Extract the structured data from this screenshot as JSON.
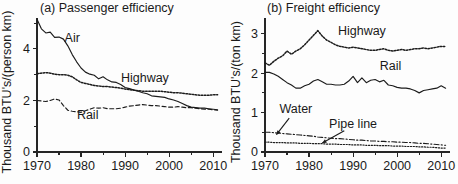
{
  "figure": {
    "width": 458,
    "height": 184,
    "background": "#ffffff",
    "ink_color": "#1c1c1c"
  },
  "chart_data": [
    {
      "type": "line",
      "panel_id": "a",
      "title": "(a) Passenger efficiency",
      "xlabel": "",
      "ylabel": "Thousand BTU's/(person km)",
      "xlim": [
        1970,
        2012
      ],
      "ylim": [
        0,
        5.2
      ],
      "xticks": [
        1970,
        1980,
        1990,
        2000,
        2010
      ],
      "xticklabels": [
        "1970",
        "1980",
        "1990",
        "2000",
        "2010"
      ],
      "xminorticks": [
        1975,
        1985,
        1995,
        2005
      ],
      "yticks": [
        0,
        2,
        4
      ],
      "yticklabels": [
        "0",
        "2",
        "4"
      ],
      "yminorticks": [
        1,
        3,
        5
      ],
      "grid": false,
      "legend_position": "inline-labels",
      "x": [
        1970,
        1971,
        1972,
        1973,
        1974,
        1975,
        1976,
        1977,
        1978,
        1979,
        1980,
        1981,
        1982,
        1983,
        1984,
        1985,
        1986,
        1987,
        1988,
        1989,
        1990,
        1991,
        1992,
        1993,
        1994,
        1995,
        1996,
        1997,
        1998,
        1999,
        2000,
        2001,
        2002,
        2003,
        2004,
        2005,
        2006,
        2007,
        2008,
        2009,
        2010,
        2011
      ],
      "series": [
        {
          "name": "Air",
          "linestyle": "solid",
          "label_x": 1978.0,
          "label_y": 4.25,
          "values": [
            5.15,
            4.78,
            4.62,
            4.65,
            4.45,
            4.46,
            4.38,
            4.12,
            3.78,
            3.5,
            3.26,
            3.1,
            3.02,
            2.98,
            2.84,
            2.92,
            2.8,
            2.72,
            2.7,
            2.62,
            2.5,
            2.46,
            2.4,
            2.36,
            2.3,
            2.26,
            2.18,
            2.16,
            2.14,
            2.12,
            2.06,
            2.02,
            1.96,
            1.88,
            1.8,
            1.74,
            1.72,
            1.7,
            1.7,
            1.68,
            1.66,
            1.64
          ]
        },
        {
          "name": "Highway",
          "linestyle": "dotted",
          "label_x": 1994.5,
          "label_y": 2.7,
          "values": [
            3.04,
            3.06,
            3.08,
            3.06,
            3.02,
            3.0,
            3.0,
            2.98,
            2.92,
            2.8,
            2.7,
            2.66,
            2.62,
            2.58,
            2.56,
            2.54,
            2.54,
            2.52,
            2.5,
            2.48,
            2.44,
            2.42,
            2.4,
            2.38,
            2.36,
            2.36,
            2.36,
            2.36,
            2.36,
            2.34,
            2.32,
            2.3,
            2.3,
            2.28,
            2.26,
            2.24,
            2.22,
            2.2,
            2.2,
            2.2,
            2.22,
            2.22
          ]
        },
        {
          "name": "Rail",
          "linestyle": "dashed",
          "label_x": 1981.5,
          "label_y": 1.3,
          "values": [
            2.0,
            1.98,
            1.96,
            2.0,
            2.06,
            2.02,
            1.8,
            1.62,
            1.58,
            1.56,
            1.54,
            1.6,
            1.66,
            1.72,
            1.7,
            1.72,
            1.68,
            1.68,
            1.68,
            1.7,
            1.74,
            1.78,
            1.8,
            1.82,
            1.84,
            1.82,
            1.8,
            1.8,
            1.78,
            1.76,
            1.74,
            1.74,
            1.76,
            1.74,
            1.72,
            1.72,
            1.7,
            1.68,
            1.66,
            1.66,
            1.64,
            1.62
          ]
        }
      ]
    },
    {
      "type": "line",
      "panel_id": "b",
      "title": "(b) Freight efficiency",
      "xlabel": "",
      "ylabel": "Thousand BTU's/(ton km)",
      "xlim": [
        1970,
        2012
      ],
      "ylim": [
        0,
        3.4
      ],
      "xticks": [
        1970,
        1980,
        1990,
        2000,
        2010
      ],
      "xticklabels": [
        "1970",
        "1980",
        "1990",
        "2000",
        "2010"
      ],
      "xminorticks": [
        1975,
        1985,
        1995,
        2005
      ],
      "yticks": [
        0,
        1,
        2,
        3
      ],
      "yticklabels": [
        "0",
        "1",
        "2",
        "3"
      ],
      "yminorticks": [
        0.5,
        1.5,
        2.5
      ],
      "grid": false,
      "legend_position": "inline-labels",
      "x": [
        1970,
        1971,
        1972,
        1973,
        1974,
        1975,
        1976,
        1977,
        1978,
        1979,
        1980,
        1981,
        1982,
        1983,
        1984,
        1985,
        1986,
        1987,
        1988,
        1989,
        1990,
        1991,
        1992,
        1993,
        1994,
        1995,
        1996,
        1997,
        1998,
        1999,
        2000,
        2001,
        2002,
        2003,
        2004,
        2005,
        2006,
        2007,
        2008,
        2009,
        2010,
        2011
      ],
      "series": [
        {
          "name": "Highway",
          "linestyle": "dotted",
          "label_x": 1992.0,
          "label_y": 2.96,
          "values": [
            2.26,
            2.2,
            2.3,
            2.38,
            2.44,
            2.56,
            2.48,
            2.56,
            2.62,
            2.72,
            2.84,
            2.96,
            3.08,
            2.94,
            2.84,
            2.78,
            2.72,
            2.68,
            2.66,
            2.64,
            2.66,
            2.64,
            2.62,
            2.6,
            2.58,
            2.58,
            2.6,
            2.62,
            2.58,
            2.56,
            2.58,
            2.6,
            2.58,
            2.6,
            2.62,
            2.62,
            2.64,
            2.62,
            2.64,
            2.66,
            2.68,
            2.68
          ]
        },
        {
          "name": "Rail",
          "linestyle": "solid",
          "label_x": 1998.5,
          "label_y": 2.08,
          "values": [
            2.02,
            2.02,
            1.98,
            1.92,
            1.84,
            1.76,
            1.7,
            1.62,
            1.62,
            1.68,
            1.72,
            1.8,
            1.84,
            1.78,
            1.72,
            1.72,
            1.7,
            1.7,
            1.72,
            1.8,
            1.92,
            1.76,
            1.88,
            1.76,
            1.82,
            1.84,
            1.78,
            1.82,
            1.7,
            1.68,
            1.64,
            1.62,
            1.62,
            1.6,
            1.56,
            1.5,
            1.56,
            1.58,
            1.6,
            1.62,
            1.68,
            1.62
          ]
        },
        {
          "name": "Water",
          "linestyle": "dashdot",
          "label_x": 1977.0,
          "label_y": 0.98,
          "values": [
            0.5,
            0.5,
            0.49,
            0.48,
            0.47,
            0.46,
            0.45,
            0.44,
            0.43,
            0.42,
            0.41,
            0.4,
            0.38,
            0.37,
            0.36,
            0.35,
            0.34,
            0.34,
            0.33,
            0.32,
            0.31,
            0.3,
            0.3,
            0.29,
            0.28,
            0.28,
            0.27,
            0.27,
            0.26,
            0.26,
            0.25,
            0.25,
            0.24,
            0.24,
            0.23,
            0.22,
            0.22,
            0.21,
            0.2,
            0.19,
            0.18,
            0.17
          ]
        },
        {
          "name": "Pipe line",
          "linestyle": "fine-dotted",
          "label_x": 1990.0,
          "label_y": 0.62,
          "values": [
            0.25,
            0.25,
            0.24,
            0.24,
            0.24,
            0.23,
            0.23,
            0.23,
            0.22,
            0.22,
            0.22,
            0.21,
            0.21,
            0.21,
            0.2,
            0.2,
            0.2,
            0.19,
            0.19,
            0.19,
            0.18,
            0.18,
            0.18,
            0.17,
            0.17,
            0.17,
            0.16,
            0.16,
            0.16,
            0.15,
            0.15,
            0.15,
            0.14,
            0.14,
            0.14,
            0.13,
            0.13,
            0.12,
            0.12,
            0.11,
            0.1,
            0.1
          ]
        }
      ],
      "annotations": [
        {
          "name": "water-pointer",
          "from_x": 1975.5,
          "from_y": 0.86,
          "to_x": 1972.6,
          "to_y": 0.44
        },
        {
          "name": "pipeline-pointer",
          "from_x": 1988.0,
          "from_y": 0.54,
          "to_x": 1983.0,
          "to_y": 0.23
        }
      ]
    }
  ]
}
